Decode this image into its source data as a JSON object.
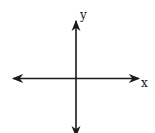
{
  "diagram": {
    "type": "coordinate-axes",
    "x_axis": {
      "label": "x",
      "bidirectional": true
    },
    "y_axis": {
      "label": "y",
      "bidirectional": true
    },
    "line_color": "#1a1a1a",
    "background": "#ffffff"
  }
}
